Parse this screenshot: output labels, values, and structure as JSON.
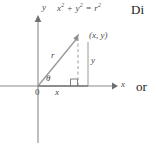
{
  "figure": {
    "title_equation": "x2 + y2 = r2",
    "equation_parts": {
      "x": "x",
      "y": "y",
      "r": "r",
      "exp": "2",
      "plus": "+",
      "equals": "="
    },
    "axis_labels": {
      "y_axis": "y",
      "x_axis": "x",
      "origin": "0"
    },
    "annotations": {
      "point": "(x, y)",
      "radius": "r",
      "vertical_leg": "y",
      "horizontal_leg": "x",
      "angle": "θ"
    },
    "colors": {
      "axis": "#8a8a8a",
      "radius_line": "#9a9a9a",
      "dashed_line": "#9a9a9a",
      "leg_line": "#9a9a9a",
      "text": "#4a4a4a",
      "body_text": "#1d1d1d",
      "background": "#ffffff"
    },
    "geometry": {
      "origin_px": [
        38,
        86
      ],
      "point_px": [
        78,
        37
      ],
      "x_axis_end_px": [
        116,
        86
      ],
      "y_axis_top_px": [
        38,
        18
      ],
      "y_axis_bottom_px": [
        38,
        142
      ],
      "leg_line_x_px": 88,
      "leg_line_top_px": 42,
      "right_angle_size_px": 7
    }
  },
  "side_text": {
    "top": "Di",
    "middle": "or"
  }
}
